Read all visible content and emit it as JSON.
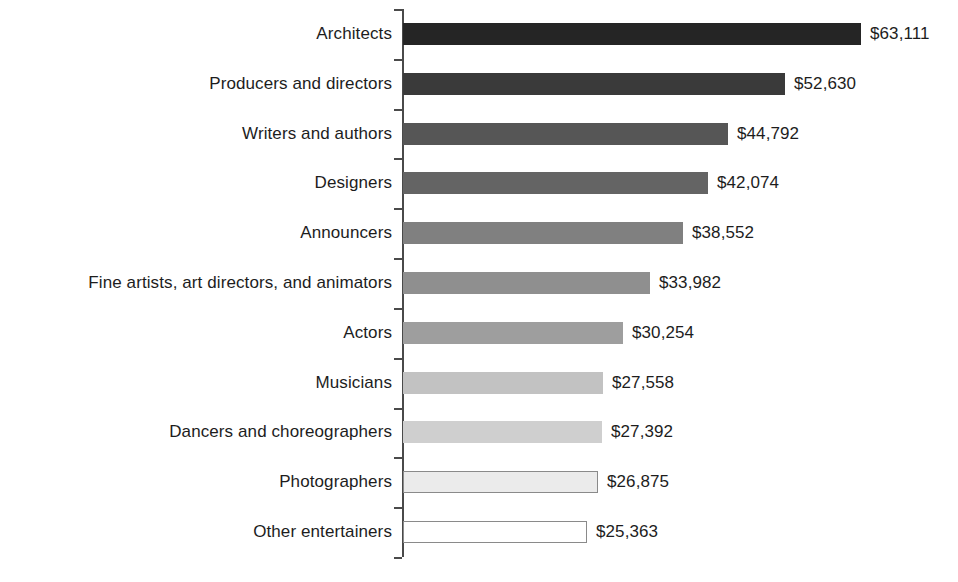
{
  "chart_data": {
    "type": "bar",
    "orientation": "horizontal",
    "title": "",
    "subtitle": "",
    "xlabel": "",
    "ylabel": "",
    "grid": false,
    "legend": null,
    "axis_ticks_visible": true,
    "value_labels_shown": true,
    "value_prefix": "$",
    "xlim": [
      0,
      63111
    ],
    "categories": [
      "Architects",
      "Producers and directors",
      "Writers and authors",
      "Designers",
      "Announcers",
      "Fine artists, art directors, and animators",
      "Actors",
      "Musicians",
      "Dancers and choreographers",
      "Photographers",
      "Other entertainers"
    ],
    "values": [
      63111,
      52630,
      44792,
      42074,
      38552,
      33982,
      30254,
      27558,
      27392,
      26875,
      25363
    ],
    "value_labels": [
      "$63,111",
      "$52,630",
      "$44,792",
      "$42,074",
      "$38,552",
      "$33,982",
      "$30,254",
      "$27,558",
      "$27,392",
      "$26,875",
      "$25,363"
    ],
    "bar_colors": [
      "#252525",
      "#3a3a3a",
      "#565656",
      "#646464",
      "#808080",
      "#8f8f8f",
      "#9e9e9e",
      "#c2c2c2",
      "#cfcfcf",
      "#ebebeb",
      "#ffffff"
    ],
    "bar_border_color": "#8a8a8a",
    "axis_color": "#4a4a4a",
    "text_color": "#1d1d1d",
    "background_color": "#ffffff"
  }
}
